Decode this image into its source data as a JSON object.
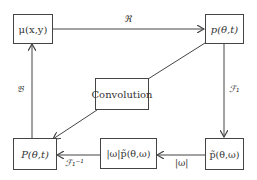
{
  "nodes": {
    "mu": "μ(x,y)",
    "p": "p(θ,t)",
    "convolution": "Convolution",
    "P": "P(θ,t)",
    "omega_ptilde": "|ω|p̃(θ,ω)",
    "ptilde": "p̃(θ,ω)"
  },
  "edges": {
    "radon": "ℜ",
    "fourier": "ℱ₁",
    "omega": "|ω|",
    "inverse_fourier": "ℱ₁⁻¹",
    "backprojection": "𝔅"
  }
}
